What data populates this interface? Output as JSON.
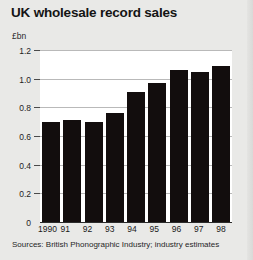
{
  "chart_data": {
    "type": "bar",
    "title": "UK wholesale record sales",
    "xlabel": "",
    "ylabel": "£bn",
    "categories": [
      "1990",
      "91",
      "92",
      "93",
      "94",
      "95",
      "96",
      "97",
      "98"
    ],
    "values": [
      0.7,
      0.71,
      0.7,
      0.76,
      0.91,
      0.97,
      1.06,
      1.05,
      1.09
    ],
    "ylim": [
      0,
      1.2
    ],
    "yticks": [
      "0",
      "0.2",
      "0.4",
      "0.6",
      "0.8",
      "1.0",
      "1.2"
    ],
    "ytick_values": [
      0,
      0.2,
      0.4,
      0.6,
      0.8,
      1.0,
      1.2
    ],
    "grid": true,
    "legend": false,
    "bar_color": "#120d0d",
    "plot_background": "#ffffff",
    "page_background": "#e9e9e7",
    "source_note": "Sources: British Phonographic Industry; industry estimates"
  }
}
